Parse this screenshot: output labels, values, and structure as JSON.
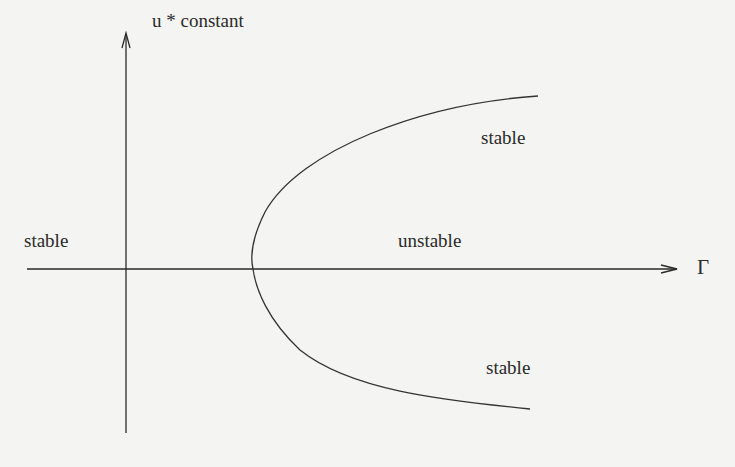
{
  "axes": {
    "y_label": "u * constant",
    "x_label": "Γ"
  },
  "regions": [
    {
      "id": "left",
      "label": "stable"
    },
    {
      "id": "inside",
      "label": "unstable"
    },
    {
      "id": "upper",
      "label": "stable"
    },
    {
      "id": "lower",
      "label": "stable"
    }
  ],
  "curve": {
    "shape": "parabola opening right",
    "vertex": [
      253,
      269
    ],
    "upper_end": [
      538,
      96
    ],
    "lower_end": [
      530,
      409
    ]
  },
  "colors": {
    "background": "#f4f4f2",
    "ink": "#2a2a2a"
  }
}
